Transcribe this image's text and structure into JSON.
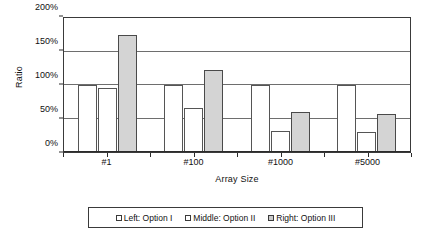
{
  "chart_data": {
    "type": "bar",
    "title": "",
    "xlabel": "Array Size",
    "ylabel": "Ratio",
    "categories": [
      "#1",
      "#100",
      "#1000",
      "#5000"
    ],
    "series": [
      {
        "name": "Left: Option I",
        "values": [
          100,
          100,
          100,
          100
        ],
        "fill": "#ffffff"
      },
      {
        "name": "Middle: Option II",
        "values": [
          95,
          65,
          32,
          30
        ],
        "fill": "#ffffff"
      },
      {
        "name": "Right: Option III",
        "values": [
          175,
          122,
          60,
          56
        ],
        "fill": "#d4d4d4"
      }
    ],
    "ylim": [
      0,
      200
    ],
    "yticks": [
      0,
      50,
      100,
      150,
      200
    ],
    "ytick_labels": [
      "0%",
      "50%",
      "100%",
      "150%",
      "200%"
    ],
    "grid": true,
    "legend_position": "bottom",
    "value_unit": "%"
  },
  "legend": {
    "items": [
      {
        "label": "Left: Option I"
      },
      {
        "label": "Middle:  Option II"
      },
      {
        "label": "Right:  Option III"
      }
    ]
  }
}
